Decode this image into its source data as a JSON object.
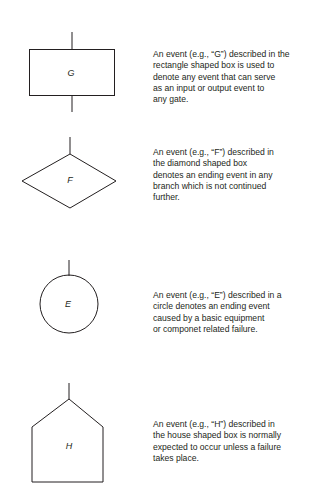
{
  "diagram": {
    "type": "fault-tree-event-symbols-legend",
    "symbols": [
      {
        "shape": "rectangle",
        "label": "G",
        "description_lines": [
          "An event  (e.g., “G”) described in the",
          "rectangle shaped box is used to",
          "denote any event that can serve",
          "as  an input or output event to",
          "any gate."
        ]
      },
      {
        "shape": "diamond",
        "label": "F",
        "description_lines": [
          "An event (e.g., “F”) described in",
          "the diamond shaped box",
          "denotes an ending event in any",
          "branch which is not continued",
          "further."
        ]
      },
      {
        "shape": "circle",
        "label": "E",
        "description_lines": [
          "An event  (e.g., “E”) described in a",
          "circle denotes an ending  event",
          "caused by a basic equipment",
          "or componet related failure."
        ]
      },
      {
        "shape": "house",
        "label": "H",
        "description_lines": [
          "An event (e.g., “H”) described in",
          "the house shaped box is normally",
          "expected to occur unless a  failure",
          "takes place."
        ]
      }
    ],
    "colors": {
      "stroke": "#231f20",
      "text": "#231f20",
      "background": "#ffffff"
    }
  }
}
